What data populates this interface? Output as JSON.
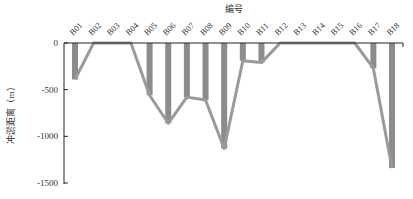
{
  "chart_data": {
    "type": "bar",
    "title": "",
    "xlabel": "编号",
    "ylabel": "冲淤距离（m）",
    "x_axis_position": "top",
    "categories": [
      "B01",
      "B02",
      "B03",
      "B04",
      "B05",
      "B06",
      "B07",
      "B08",
      "B09",
      "B10",
      "B11",
      "B12",
      "B13",
      "B14",
      "B15",
      "B16",
      "B17",
      "B18"
    ],
    "values": [
      -390,
      0,
      0,
      0,
      -560,
      -860,
      -580,
      -610,
      -1130,
      -190,
      -210,
      0,
      0,
      0,
      0,
      0,
      -270,
      -1340
    ],
    "overlay_line": true,
    "ylim": [
      -1500,
      0
    ],
    "yticks": [
      0,
      -500,
      -1000,
      -1500
    ],
    "ytick_labels": [
      "0",
      "-500",
      "-1000",
      "-1500"
    ],
    "grid": false,
    "legend": null,
    "bar_color": "#8c8c8c",
    "line_color": "#9a9a9a"
  }
}
